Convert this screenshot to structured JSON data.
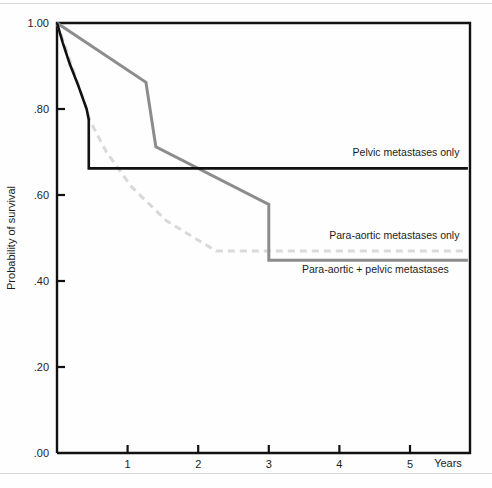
{
  "chart_data": {
    "type": "line",
    "title": "",
    "xlabel": "Years",
    "ylabel": "Probability of survival",
    "xlim": [
      0,
      5.85
    ],
    "ylim": [
      0.0,
      1.0
    ],
    "grid": false,
    "legend_position": "inline-right",
    "x_ticks": [
      "1",
      "2",
      "3",
      "4",
      "5"
    ],
    "x_tick_values": [
      1,
      2,
      3,
      4,
      5
    ],
    "y_ticks": [
      "1.00",
      ".80",
      ".60",
      ".40",
      ".20",
      ".00"
    ],
    "y_tick_values": [
      1.0,
      0.8,
      0.6,
      0.4,
      0.2,
      0.0
    ],
    "series": [
      {
        "name": "Pelvic metastases only",
        "color": "#111111",
        "style": "solid",
        "width": 2.6,
        "points": [
          [
            0.0,
            1.0
          ],
          [
            0.08,
            0.955
          ],
          [
            0.18,
            0.905
          ],
          [
            0.3,
            0.855
          ],
          [
            0.42,
            0.8
          ],
          [
            0.45,
            0.775
          ],
          [
            0.45,
            0.662
          ],
          [
            5.82,
            0.662
          ]
        ]
      },
      {
        "name": "Para-aortic metastases only",
        "color": "#d9d9d9",
        "style": "dashed",
        "width": 3.0,
        "points": [
          [
            0.0,
            1.0
          ],
          [
            0.2,
            0.905
          ],
          [
            0.4,
            0.81
          ],
          [
            0.46,
            0.775
          ],
          [
            0.7,
            0.7
          ],
          [
            1.05,
            0.62
          ],
          [
            1.55,
            0.54
          ],
          [
            2.25,
            0.47
          ],
          [
            5.82,
            0.47
          ]
        ]
      },
      {
        "name": "Para-aortic + pelvic metastases",
        "color": "#8c8c8c",
        "style": "solid",
        "width": 3.0,
        "points": [
          [
            0.0,
            1.0
          ],
          [
            1.26,
            0.862
          ],
          [
            1.4,
            0.712
          ],
          [
            3.0,
            0.578
          ],
          [
            3.0,
            0.448
          ],
          [
            5.82,
            0.448
          ]
        ]
      }
    ],
    "annotations": [
      {
        "text": "Pelvic metastases only",
        "x": 5.7,
        "y": 0.69
      },
      {
        "text": "Para-aortic metastases only",
        "x": 5.7,
        "y": 0.497
      },
      {
        "text": "Para-aortic + pelvic metastases",
        "x": 5.55,
        "y": 0.418
      }
    ]
  }
}
